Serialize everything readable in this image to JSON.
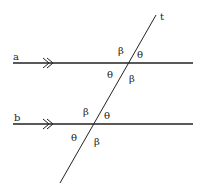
{
  "diagram": {
    "lines": {
      "a": "a",
      "b": "b",
      "t": "t"
    },
    "angles_a": {
      "upper_left": "β",
      "upper_right": "θ",
      "lower_left": "θ",
      "lower_right": "β"
    },
    "angles_b": {
      "upper_left": "β",
      "upper_right": "θ",
      "lower_left": "θ",
      "lower_right": "β"
    },
    "parallel_marker": "double-arrow",
    "colors": {
      "line": "#222222",
      "background": "#ffffff"
    }
  }
}
